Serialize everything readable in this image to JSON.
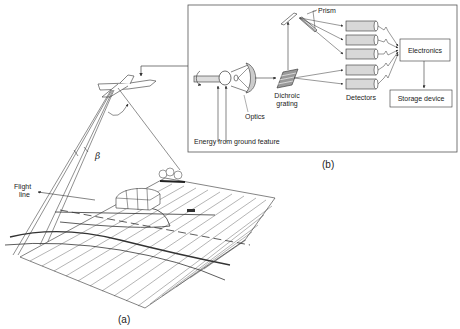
{
  "figure": {
    "panel_a": {
      "caption": "(a)",
      "labels": {
        "flight_line": [
          "Flight",
          "line"
        ],
        "beta": "β"
      }
    },
    "panel_b": {
      "caption": "(b)",
      "labels": {
        "prism": "Prism",
        "electronics": "Electronics",
        "storage": "Storage device",
        "dichroic": [
          "Dichroic",
          "grating"
        ],
        "optics": "Optics",
        "detectors": "Detectors",
        "energy": "Energy from ground feature"
      },
      "detector_count": 5
    }
  },
  "colors": {
    "line": "#333333",
    "detector_fill": "#d8d8d8",
    "background": "#ffffff"
  }
}
